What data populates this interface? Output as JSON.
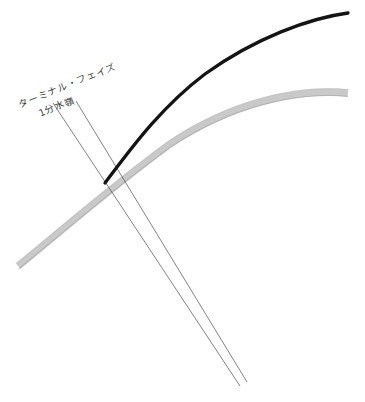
{
  "figure": {
    "title_visible": false,
    "background_color": "#ffffff",
    "width": 365,
    "height": 402,
    "annotations": [
      {
        "id": "terminal-phase",
        "text": "ターミナル・フェイズ",
        "rotation_deg": -22,
        "color": "#3a3a3a"
      },
      {
        "id": "watershed",
        "text": "1分水嶺",
        "rotation_deg": -22,
        "color": "#3a3a3a"
      }
    ],
    "curves": [
      {
        "id": "upper-black-curve",
        "color": "#141414",
        "stroke_width": 3.2,
        "description": "steep rising concave-down curve terminating at right edge top"
      },
      {
        "id": "lower-gray-curve",
        "color": "#c9c9c9",
        "outline_color": "#8a8a8a",
        "stroke_width": 7,
        "description": "broad shallow rising band crossing from lower-left to right edge"
      }
    ],
    "leader_lines": [
      {
        "id": "leader-line-1",
        "color": "#4a4a4a",
        "stroke_width": 0.7
      },
      {
        "id": "leader-line-2",
        "color": "#4a4a4a",
        "stroke_width": 0.7
      }
    ]
  }
}
